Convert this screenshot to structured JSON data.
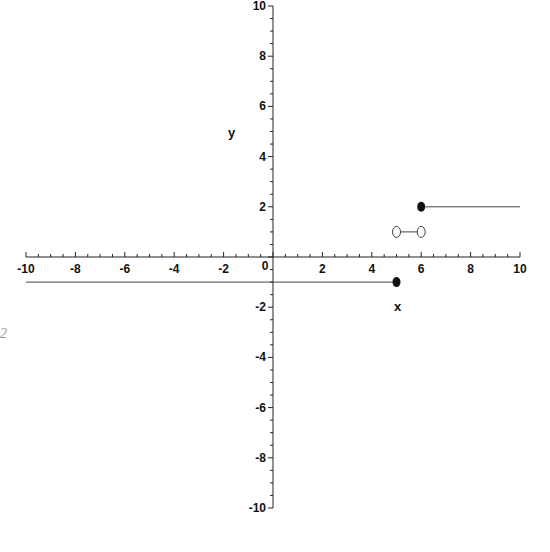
{
  "chart_data": {
    "type": "line",
    "title": "",
    "xlabel": "x",
    "ylabel": "y",
    "xlim": [
      -10,
      10
    ],
    "ylim": [
      -10,
      10
    ],
    "grid": false,
    "legend": null,
    "x_ticks": [
      -10,
      -8,
      -6,
      -4,
      -2,
      0,
      2,
      4,
      6,
      8,
      10
    ],
    "y_ticks": [
      -10,
      -8,
      -6,
      -4,
      -2,
      2,
      4,
      6,
      8,
      10
    ],
    "x_tick_labels": [
      "-10",
      "-8",
      "-6",
      "-4",
      "-2",
      "0",
      "2",
      "4",
      "6",
      "8",
      "10"
    ],
    "y_tick_labels": [
      "-10",
      "-8",
      "-6",
      "-4",
      "-2",
      "2",
      "4",
      "6",
      "8",
      "10"
    ],
    "series": [
      {
        "name": "segment-left",
        "kind": "line",
        "x": [
          -10,
          5
        ],
        "y": [
          -1,
          -1
        ]
      },
      {
        "name": "segment-middle",
        "kind": "line",
        "x": [
          5,
          6
        ],
        "y": [
          1,
          1
        ]
      },
      {
        "name": "segment-right",
        "kind": "line",
        "x": [
          6,
          10
        ],
        "y": [
          2,
          2
        ]
      }
    ],
    "points": [
      {
        "x": 5,
        "y": -1,
        "style": "closed"
      },
      {
        "x": 5,
        "y": 1,
        "style": "open"
      },
      {
        "x": 6,
        "y": 1,
        "style": "open"
      },
      {
        "x": 6,
        "y": 2,
        "style": "closed"
      }
    ]
  },
  "labels": {
    "x_axis": "x",
    "y_axis": "y",
    "edge_glyph": "2"
  }
}
